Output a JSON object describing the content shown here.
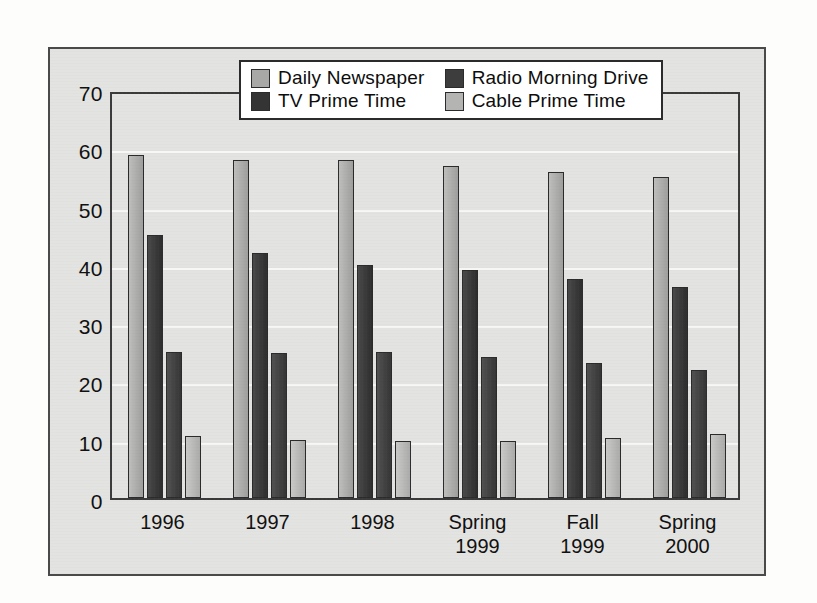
{
  "chart_data": {
    "type": "bar",
    "title": "",
    "subtitle": "",
    "xlabel": "",
    "ylabel": "",
    "ylim": [
      0,
      70
    ],
    "ytick_step": 10,
    "yticks": [
      0,
      10,
      20,
      30,
      40,
      50,
      60,
      70
    ],
    "grid": true,
    "grid_axis": "y",
    "legend_position": "top-center",
    "categories": [
      "1996",
      "1997",
      "1998",
      "Spring\n1999",
      "Fall\n1999",
      "Spring\n2000"
    ],
    "series": [
      {
        "name": "Daily Newspaper",
        "color": "#a8a8a6",
        "values": [
          58.8,
          58.0,
          58.0,
          57.0,
          56.0,
          55.0
        ]
      },
      {
        "name": "TV Prime Time",
        "color": "#343434",
        "values": [
          45.2,
          42.0,
          40.0,
          39.2,
          37.5,
          36.2
        ]
      },
      {
        "name": "Radio Morning Drive",
        "color": "#3d3d3d",
        "values": [
          25.0,
          24.8,
          25.0,
          24.2,
          23.2,
          22.0
        ]
      },
      {
        "name": "Cable Prime Time",
        "color": "#b4b4b2",
        "values": [
          10.6,
          10.0,
          9.8,
          9.7,
          10.3,
          10.9
        ]
      }
    ]
  },
  "legend": {
    "entries": [
      {
        "label": "Daily Newspaper",
        "swatch": "#a8a8a6"
      },
      {
        "label": "Radio Morning Drive",
        "swatch": "#3d3d3d"
      },
      {
        "label": "TV Prime Time",
        "swatch": "#343434"
      },
      {
        "label": "Cable Prime Time",
        "swatch": "#b4b4b2"
      }
    ]
  },
  "axis": {
    "y_tick_labels": [
      "70",
      "60",
      "50",
      "40",
      "30",
      "20",
      "10",
      "0"
    ]
  }
}
